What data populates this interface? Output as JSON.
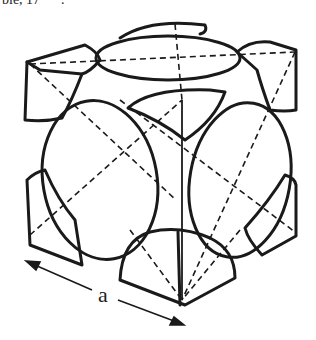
{
  "header_fragment": "ble, 17      .",
  "diagram": {
    "dimension_label": "a",
    "stroke_color": "#1a1a1a",
    "background": "#ffffff"
  }
}
